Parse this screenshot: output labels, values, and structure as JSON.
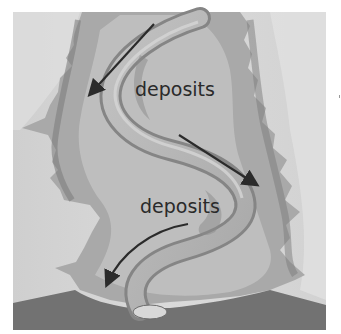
{
  "figure": {
    "labels": [
      {
        "text": "deposits",
        "x": 135,
        "y": 96
      },
      {
        "text": "deposits",
        "x": 140,
        "y": 213
      }
    ],
    "arrows": [
      {
        "name": "flow-arrow-upper-left",
        "from": [
          154,
          24
        ],
        "to": [
          89,
          95
        ]
      },
      {
        "name": "flow-arrow-right",
        "from": [
          179,
          135
        ],
        "to": [
          258,
          186
        ]
      },
      {
        "name": "flow-arrow-lower-left",
        "from": [
          188,
          224
        ],
        "to": [
          105,
          285
        ]
      }
    ],
    "colors": {
      "background": "#ffffff",
      "paper": "#d9d9d9",
      "land_dark": "#8a8a8a",
      "land_mid": "#aaaaaa",
      "floodplain": "#c4c4c4",
      "river": "#b8b8b8",
      "river_edge": "#7a7a7a",
      "ground": "#6f6f6f",
      "arrow": "#2b2b2b",
      "text": "#2a2a2a"
    }
  }
}
